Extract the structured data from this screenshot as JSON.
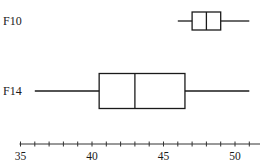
{
  "chart_data": {
    "type": "boxplot",
    "title": "",
    "xlabel": "",
    "ylabel": "",
    "orientation": "horizontal",
    "xlim": [
      35,
      51.5
    ],
    "x_ticks_major": [
      35,
      40,
      45,
      50
    ],
    "x_tick_labels": [
      "35",
      "40",
      "45",
      "50"
    ],
    "x_minor_step": 1,
    "grid": false,
    "series": [
      {
        "name": "F10",
        "min": 46,
        "q1": 47,
        "median": 48,
        "q3": 49,
        "max": 51
      },
      {
        "name": "F14",
        "min": 36,
        "q1": 40.5,
        "median": 43,
        "q3": 46.5,
        "max": 51
      }
    ]
  }
}
